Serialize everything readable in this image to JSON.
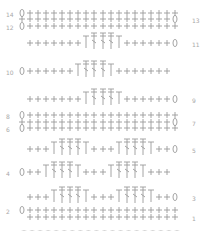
{
  "colors": {
    "stitch": "#9a9a9a",
    "label": "#a8a8a8"
  },
  "legend_symbols": {
    "+": "single crochet",
    "0": "chain (turning)",
    "T": "double crochet",
    "X": "crossed double crochet",
    "chain": "foundation chain"
  },
  "rows": [
    {
      "num": "14",
      "side": "left",
      "y": 13,
      "stitches": "0+++++++++++++++++++"
    },
    {
      "num": "13",
      "side": "right",
      "y": 19,
      "stitches": "+++++++++++++++++++0"
    },
    {
      "num": "12",
      "side": "left",
      "y": 26,
      "stitches": "0+++++++++++++++++++"
    },
    {
      "num": "11",
      "side": "right",
      "y": 43,
      "stitches": "+++++++TXXXT++++++0"
    },
    {
      "num": "10",
      "side": "left",
      "y": 71,
      "stitches": "0++++++TXXXT+++++++"
    },
    {
      "num": "9",
      "side": "right",
      "y": 99,
      "stitches": "+++++++TXXXT++++++0"
    },
    {
      "num": "8",
      "side": "left",
      "y": 115,
      "stitches": "0+++++++++++++++++++"
    },
    {
      "num": "7",
      "side": "right",
      "y": 122,
      "stitches": "+++++++++++++++++++0"
    },
    {
      "num": "6",
      "side": "left",
      "y": 128,
      "stitches": "0+++++++++++++++++++"
    },
    {
      "num": "5",
      "side": "right",
      "y": 149,
      "stitches": "+++TXXXT+++TXXXT++0"
    },
    {
      "num": "4",
      "side": "left",
      "y": 172,
      "stitches": "0++TXXXT+++TXXXT+++"
    },
    {
      "num": "3",
      "side": "right",
      "y": 197,
      "stitches": "+++TXXXT+++TXXXT++0"
    },
    {
      "num": "2",
      "side": "left",
      "y": 210,
      "stitches": "0+++++++++++++++++++"
    },
    {
      "num": "1",
      "side": "right",
      "y": 217,
      "stitches": "+++++++++++++++++++"
    }
  ],
  "foundation_chain_count": 20
}
